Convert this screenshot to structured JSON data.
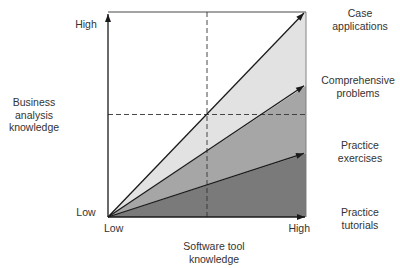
{
  "chart_data": {
    "type": "area",
    "title": "",
    "xlabel": "Software tool knowledge",
    "ylabel": "Business analysis knowledge",
    "x_ticks": [
      "Low",
      "High"
    ],
    "y_ticks": [
      "Low",
      "High"
    ],
    "xlim": [
      0,
      1
    ],
    "ylim": [
      0,
      1
    ],
    "reference_lines": {
      "x": 0.5,
      "y": 0.5,
      "style": "dashed"
    },
    "series": [
      {
        "name": "Case applications",
        "x": [
          0,
          1
        ],
        "y": [
          0,
          1.0
        ],
        "fill": "#ffffff"
      },
      {
        "name": "Comprehensive problems",
        "x": [
          0,
          1
        ],
        "y": [
          0,
          0.64
        ],
        "fill": "#e2e2e2"
      },
      {
        "name": "Practice exercises",
        "x": [
          0,
          1
        ],
        "y": [
          0,
          0.31
        ],
        "fill": "#a6a6a6"
      },
      {
        "name": "Practice tutorials",
        "x": [
          0,
          1
        ],
        "y": [
          0,
          0.0
        ],
        "fill": "#7a7a7a"
      }
    ],
    "region_labels": [
      {
        "text": "Case applications",
        "lines": [
          "Case",
          "applications"
        ]
      },
      {
        "text": "Comprehensive problems",
        "lines": [
          "Comprehensive",
          "problems"
        ]
      },
      {
        "text": "Practice exercises",
        "lines": [
          "Practice",
          "exercises"
        ]
      },
      {
        "text": "Practice tutorials",
        "lines": [
          "Practice",
          "tutorials"
        ]
      }
    ],
    "band_fills": [
      "#e2e2e2",
      "#a6a6a6",
      "#7a7a7a"
    ],
    "grid": false,
    "legend": "right"
  },
  "labels": {
    "y_axis": [
      "Business",
      "analysis",
      "knowledge"
    ],
    "x_axis": [
      "Software tool",
      "knowledge"
    ],
    "y_high": "High",
    "y_low": "Low",
    "x_low": "Low",
    "x_high": "High"
  }
}
